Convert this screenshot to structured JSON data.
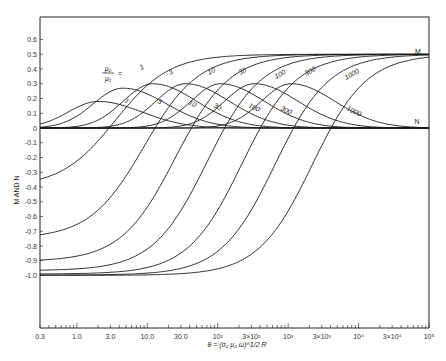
{
  "chart_data": {
    "type": "line",
    "title": "",
    "xlabel": "θ = (σ₂ μ₂ ω)^1/2 R",
    "ylabel": "M AND N",
    "x_scale": "log",
    "xlim": [
      0.3,
      100000
    ],
    "ylim": [
      -1.0,
      0.6
    ],
    "grid": false,
    "legend": "inline curve labels; parameter μ₂/μ₁ =",
    "parameter_label": "μ₂/μ₁ =",
    "x_ticks": [
      "0.3",
      "1.0",
      "3.0",
      "10.0",
      "30.0",
      "10²",
      "3×10²",
      "10³",
      "3×10³",
      "10⁴",
      "3×10⁴",
      "10⁵"
    ],
    "x_tick_values": [
      0.3,
      1,
      3,
      10,
      30,
      100,
      300,
      1000,
      3000,
      10000,
      30000,
      100000
    ],
    "y_ticks": [
      "0.6",
      "0.5",
      "0.4",
      "0.3",
      "0.2",
      "0.1",
      "0",
      "-0.1",
      "-0.2",
      "-0.3",
      "-0.4",
      "-0.5",
      "-0.6",
      "-0.7",
      "-0.8",
      "-0.9",
      "-1.0"
    ],
    "y_tick_values": [
      0.6,
      0.5,
      0.4,
      0.3,
      0.2,
      0.1,
      0,
      -0.1,
      -0.2,
      -0.3,
      -0.4,
      -0.5,
      -0.6,
      -0.7,
      -0.8,
      -0.9,
      -1.0
    ],
    "annotations": [
      "M",
      "N"
    ],
    "series": [
      {
        "name": "M, μ₂/μ₁=1",
        "family": "M",
        "param": 1,
        "start": -0.4,
        "end": 0.5,
        "mid_x": 3.5
      },
      {
        "name": "M, μ₂/μ₁=3",
        "family": "M",
        "param": 3,
        "start": -0.75,
        "end": 0.5,
        "mid_x": 9
      },
      {
        "name": "M, μ₂/μ₁=10",
        "family": "M",
        "param": 10,
        "start": -0.905,
        "end": 0.5,
        "mid_x": 25
      },
      {
        "name": "M, μ₂/μ₁=30",
        "family": "M",
        "param": 30,
        "start": -0.967,
        "end": 0.5,
        "mid_x": 70
      },
      {
        "name": "M, μ₂/μ₁=100",
        "family": "M",
        "param": 100,
        "start": -0.99,
        "end": 0.5,
        "mid_x": 220
      },
      {
        "name": "M, μ₂/μ₁=300",
        "family": "M",
        "param": 300,
        "start": -0.997,
        "end": 0.5,
        "mid_x": 650
      },
      {
        "name": "M, μ₂/μ₁=1000",
        "family": "M",
        "param": 1000,
        "start": -0.999,
        "end": 0.5,
        "mid_x": 2200
      },
      {
        "name": "N, μ₂/μ₁=1",
        "family": "N",
        "param": 1,
        "peak": 0.18,
        "peak_x": 2.0
      },
      {
        "name": "N, μ₂/μ₁=3",
        "family": "N",
        "param": 3,
        "peak": 0.27,
        "peak_x": 4.5
      },
      {
        "name": "N, μ₂/μ₁=10",
        "family": "N",
        "param": 10,
        "peak": 0.3,
        "peak_x": 12
      },
      {
        "name": "N, μ₂/μ₁=30",
        "family": "N",
        "param": 30,
        "peak": 0.3,
        "peak_x": 35
      },
      {
        "name": "N, μ₂/μ₁=100",
        "family": "N",
        "param": 100,
        "peak": 0.3,
        "peak_x": 110
      },
      {
        "name": "N, μ₂/μ₁=300",
        "family": "N",
        "param": 300,
        "peak": 0.3,
        "peak_x": 330
      },
      {
        "name": "N, μ₂/μ₁=1000",
        "family": "N",
        "param": 1000,
        "peak": 0.3,
        "peak_x": 1100
      }
    ],
    "m_labels": [
      "1",
      "3",
      "10",
      "30",
      "100",
      "300",
      "1000"
    ],
    "n_labels": [
      "1",
      "3",
      "10",
      "30",
      "100",
      "300",
      "1000"
    ]
  }
}
